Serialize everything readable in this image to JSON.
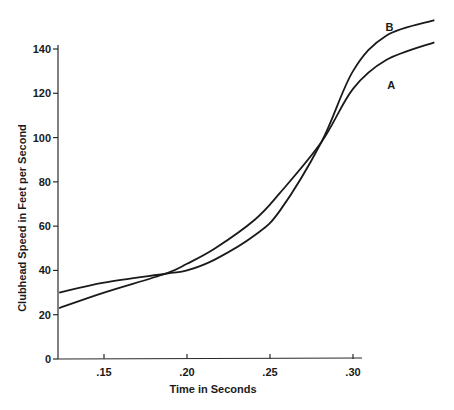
{
  "chart_data": {
    "type": "line",
    "title": "",
    "xlabel": "Time in Seconds",
    "ylabel": "Clubhead Speed in Feet per Second",
    "xlim": [
      0.123,
      0.305
    ],
    "ylim": [
      0,
      140
    ],
    "x_ticks": [
      {
        "value": 0.15,
        "label": ".15"
      },
      {
        "value": 0.2,
        "label": ".20"
      },
      {
        "value": 0.25,
        "label": ".25"
      },
      {
        "value": 0.3,
        "label": ".30"
      }
    ],
    "y_ticks": [
      {
        "value": 0,
        "label": "0"
      },
      {
        "value": 20,
        "label": "20"
      },
      {
        "value": 40,
        "label": "40"
      },
      {
        "value": 60,
        "label": "60"
      },
      {
        "value": 80,
        "label": "80"
      },
      {
        "value": 100,
        "label": "100"
      },
      {
        "value": 120,
        "label": "120"
      },
      {
        "value": 140,
        "label": "140"
      }
    ],
    "grid": false,
    "legend": "none (direct labels at curve ends)",
    "series": [
      {
        "name": "A",
        "x": [
          0.123,
          0.15,
          0.187,
          0.2,
          0.217,
          0.241,
          0.256,
          0.281,
          0.3,
          0.32,
          0.349
        ],
        "y": [
          23,
          30,
          38.5,
          43,
          50,
          63,
          75,
          98,
          122,
          135,
          143
        ]
      },
      {
        "name": "B",
        "x": [
          0.123,
          0.15,
          0.187,
          0.2,
          0.217,
          0.241,
          0.256,
          0.281,
          0.3,
          0.32,
          0.349
        ],
        "y": [
          30,
          34.5,
          38.5,
          40,
          45,
          56,
          67,
          98,
          130,
          146,
          153
        ]
      }
    ]
  }
}
